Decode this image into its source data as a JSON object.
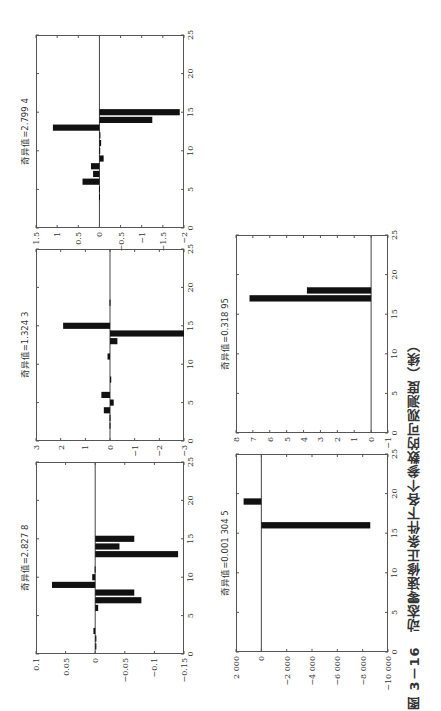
{
  "figure": {
    "number": "图 3－16",
    "caption": "动态零速修正条件下各个参数的可观测度（续）"
  },
  "chart_data": [
    {
      "type": "bar",
      "id": "sv-2.7994",
      "title": "奇异值=2.799 4",
      "xlabel": "",
      "ylabel": "",
      "xlim": [
        0,
        25
      ],
      "ylim": [
        -2,
        1.5
      ],
      "xticks": [
        0,
        5,
        10,
        15,
        20,
        25
      ],
      "yticks": [
        1.5,
        1,
        0.5,
        0,
        -0.5,
        -1,
        -1.5,
        -2
      ],
      "ytick_labels": [
        "1.5",
        "1",
        "0.5",
        "0",
        "−0.5",
        "−1",
        "−1.5",
        "−2"
      ],
      "x": [
        4,
        5,
        6,
        7,
        8,
        9,
        10,
        11,
        12,
        13,
        14,
        15
      ],
      "values": [
        0.01,
        0.01,
        0.4,
        0.15,
        0.2,
        -0.1,
        0.005,
        -0.04,
        -0.02,
        1.1,
        -1.25,
        -1.9
      ],
      "grid": false,
      "frame": {
        "left": 36,
        "top": 35,
        "right": 184,
        "bottom": 228
      }
    },
    {
      "type": "bar",
      "id": "sv-1.3243",
      "title": "奇异值=1.324 3",
      "xlabel": "",
      "ylabel": "",
      "xlim": [
        0,
        25
      ],
      "ylim": [
        -3,
        3
      ],
      "xticks": [
        0,
        5,
        10,
        15,
        20,
        25
      ],
      "yticks": [
        3,
        2,
        1,
        0,
        -1,
        -2,
        -3
      ],
      "ytick_labels": [
        "3",
        "2",
        "1",
        "0",
        "−1",
        "−2",
        "−3"
      ],
      "x": [
        2,
        3,
        4,
        5,
        6,
        8,
        11,
        13,
        14,
        15,
        18
      ],
      "values": [
        0.02,
        0.02,
        0.25,
        -0.15,
        0.35,
        -0.05,
        0.1,
        -0.3,
        -3.0,
        1.9,
        0.02
      ],
      "grid": false,
      "frame": {
        "left": 36,
        "top": 249,
        "right": 184,
        "bottom": 441
      }
    },
    {
      "type": "bar",
      "id": "sv-2.8278",
      "title": "奇异值=2.827 8",
      "xlabel": "",
      "ylabel": "",
      "xlim": [
        0,
        25
      ],
      "ylim": [
        -0.15,
        0.1
      ],
      "xticks": [
        0,
        5,
        10,
        15,
        20,
        25
      ],
      "yticks": [
        0.1,
        0.05,
        0,
        -0.05,
        -0.1,
        -0.15
      ],
      "ytick_labels": [
        "0.1",
        "0.05",
        "0",
        "−0.05",
        "−0.1",
        "−0.15"
      ],
      "x": [
        1,
        2,
        3,
        6,
        7,
        8,
        9,
        10,
        11,
        13,
        14,
        15
      ],
      "values": [
        -0.002,
        -0.002,
        0.003,
        -0.005,
        -0.078,
        -0.066,
        0.073,
        0.005,
        0.001,
        -0.14,
        -0.041,
        -0.066
      ],
      "grid": false,
      "frame": {
        "left": 36,
        "top": 462,
        "right": 184,
        "bottom": 654
      }
    },
    {
      "type": "bar",
      "id": "sv-0.31895",
      "title": "奇异值=0.318 95",
      "xlabel": "",
      "ylabel": "",
      "xlim": [
        0,
        25
      ],
      "ylim": [
        -1,
        8
      ],
      "xticks": [
        0,
        5,
        10,
        15,
        20,
        25
      ],
      "yticks": [
        8,
        7,
        6,
        5,
        4,
        3,
        2,
        1,
        0,
        -1
      ],
      "ytick_labels": [
        "8",
        "7",
        "6",
        "5",
        "4",
        "3",
        "2",
        "1",
        "0",
        "−1"
      ],
      "x": [
        17,
        18
      ],
      "values": [
        7.2,
        3.8
      ],
      "grid": false,
      "frame": {
        "left": 236,
        "top": 235,
        "right": 388,
        "bottom": 433
      }
    },
    {
      "type": "bar",
      "id": "sv-0.0013045",
      "title": "奇异值=0.001 304 5",
      "xlabel": "",
      "ylabel": "",
      "xlim": [
        0,
        25
      ],
      "ylim": [
        -10000,
        2000
      ],
      "xticks": [
        0,
        5,
        10,
        15,
        20,
        25
      ],
      "yticks": [
        2000,
        0,
        -2000,
        -4000,
        -6000,
        -8000,
        -10000
      ],
      "ytick_labels": [
        "2 000",
        "0",
        "−2 000",
        "−4 000",
        "−6 000",
        "−8 000",
        "−10 000"
      ],
      "x": [
        16,
        19
      ],
      "values": [
        -8600,
        1400
      ],
      "grid": false,
      "frame": {
        "left": 236,
        "top": 454,
        "right": 388,
        "bottom": 652
      }
    }
  ]
}
